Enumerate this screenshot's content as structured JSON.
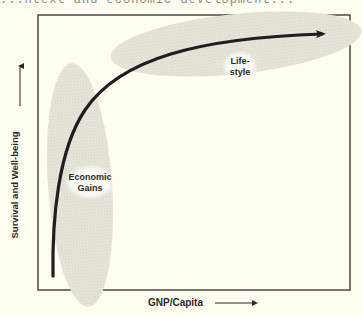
{
  "header": {
    "cut_off_text": "...ntext and economic development..."
  },
  "diagram": {
    "type": "conceptual-curve",
    "y_axis_label": "Survival and Well-being",
    "x_axis_label": "GNP/Capita",
    "regions": [
      {
        "id": "economic-gains",
        "label_line1": "Economic",
        "label_line2": "Gains"
      },
      {
        "id": "lifestyle",
        "label_line1": "Life-",
        "label_line2": "style"
      }
    ],
    "curve": "Rises steeply at low GNP/Capita (economic gains), then flattens at high GNP/Capita (lifestyle)"
  },
  "colors": {
    "background": "#fdfdf2",
    "frame": "#4a4a44",
    "curve": "#1e1e1e",
    "region_fill": "#e4e4da",
    "label_bg": "#fbfbf6",
    "text": "#2a2a2a"
  }
}
